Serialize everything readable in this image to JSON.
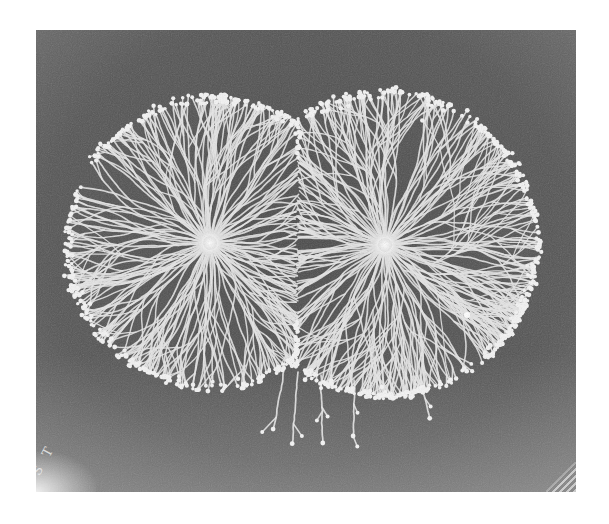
{
  "image": {
    "subject": "Two adjacent dendritic (branching) bacterial colonies on a dark agar plate, black-and-white photograph",
    "frame": {
      "x": 36,
      "y": 30,
      "width": 540,
      "height": 462
    },
    "background_color": "#5a5a5a",
    "vignette_edge_color": "#3a3a3a",
    "branch_color": "#e6e6e6",
    "corner_mark": "S T"
  },
  "colonies": [
    {
      "name": "left-colony",
      "center": {
        "x": 174,
        "y": 213
      },
      "radius": 150,
      "core_radius": 13,
      "primary_branches": 96,
      "seed": 7
    },
    {
      "name": "right-colony",
      "center": {
        "x": 349,
        "y": 215
      },
      "radius": 158,
      "core_radius": 13,
      "primary_branches": 100,
      "seed": 19
    }
  ],
  "escaped_branches": [
    {
      "x": 248,
      "y": 340,
      "angle": 100,
      "length": 60
    },
    {
      "x": 262,
      "y": 342,
      "angle": 95,
      "length": 72
    },
    {
      "x": 285,
      "y": 345,
      "angle": 88,
      "length": 68
    },
    {
      "x": 318,
      "y": 350,
      "angle": 92,
      "length": 56
    },
    {
      "x": 384,
      "y": 345,
      "angle": 80,
      "length": 42
    }
  ],
  "specks": [
    {
      "x": 431,
      "y": 285,
      "r": 3
    }
  ]
}
